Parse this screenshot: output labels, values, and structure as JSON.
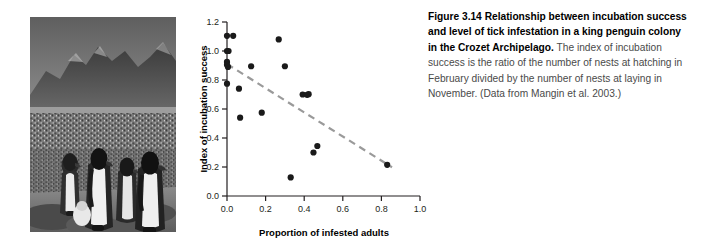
{
  "figure": {
    "photo": {
      "alt": "Black and white photograph of a king penguin colony with mountains in the background",
      "name": "king-penguin-colony-photo"
    },
    "caption": {
      "label": "Figure 3.14",
      "lead": "Relationship between incubation success and level of tick infestation in a king penguin colony in the Crozet Archipelago.",
      "body": "The index of incubation success is the ratio of the number of nests at hatching in February divided by the number of nests at laying in November. (Data from Mangin et al. 2003.)"
    }
  },
  "chart_data": {
    "type": "scatter",
    "title": "",
    "xlabel": "Proportion of infested adults",
    "ylabel": "Index of incubation success",
    "xlim": [
      0.0,
      1.0
    ],
    "ylim": [
      0.0,
      1.2
    ],
    "xticks": [
      "0.0",
      "0.2",
      "0.4",
      "0.6",
      "0.8",
      "1.0"
    ],
    "yticks": [
      "0.0",
      "0.2",
      "0.4",
      "0.6",
      "0.8",
      "1.0",
      "1.2"
    ],
    "xtick_values": [
      0.0,
      0.2,
      0.4,
      0.6,
      0.8,
      1.0
    ],
    "ytick_values": [
      0.0,
      0.2,
      0.4,
      0.6,
      0.8,
      1.0,
      1.2
    ],
    "grid": false,
    "legend": "none",
    "marker_color": "#1a1a1a",
    "trendline_color": "#9a9a9a",
    "points": [
      {
        "x": 0.0,
        "y": 1.105
      },
      {
        "x": 0.032,
        "y": 1.105
      },
      {
        "x": 0.0,
        "y": 1.0
      },
      {
        "x": 0.008,
        "y": 1.0
      },
      {
        "x": 0.0,
        "y": 0.925
      },
      {
        "x": 0.0,
        "y": 0.905
      },
      {
        "x": 0.005,
        "y": 0.89
      },
      {
        "x": 0.0,
        "y": 0.775
      },
      {
        "x": 0.062,
        "y": 0.74
      },
      {
        "x": 0.068,
        "y": 0.54
      },
      {
        "x": 0.125,
        "y": 0.895
      },
      {
        "x": 0.18,
        "y": 0.575
      },
      {
        "x": 0.268,
        "y": 1.08
      },
      {
        "x": 0.3,
        "y": 0.895
      },
      {
        "x": 0.33,
        "y": 0.128
      },
      {
        "x": 0.392,
        "y": 0.7
      },
      {
        "x": 0.415,
        "y": 0.698
      },
      {
        "x": 0.423,
        "y": 0.702
      },
      {
        "x": 0.448,
        "y": 0.3
      },
      {
        "x": 0.468,
        "y": 0.345
      },
      {
        "x": 0.83,
        "y": 0.215
      }
    ],
    "trendline": {
      "x0": 0.0,
      "y0": 0.91,
      "x1": 0.855,
      "y1": 0.198,
      "style": "dashed"
    }
  }
}
